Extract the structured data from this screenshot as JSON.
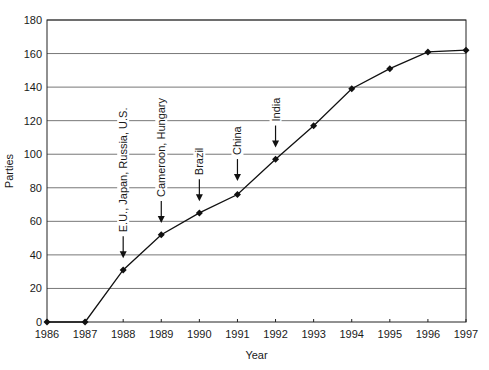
{
  "chart_data": {
    "type": "line",
    "title": "",
    "xlabel": "Year",
    "ylabel": "Parties",
    "x": [
      1986,
      1987,
      1988,
      1989,
      1990,
      1991,
      1992,
      1993,
      1994,
      1995,
      1996,
      1997
    ],
    "series": [
      {
        "name": "Parties",
        "values": [
          0,
          0,
          31,
          52,
          65,
          76,
          97,
          117,
          139,
          151,
          161,
          162
        ]
      }
    ],
    "xlim": [
      1986,
      1997
    ],
    "ylim": [
      0,
      180
    ],
    "yticks": [
      0,
      20,
      40,
      60,
      80,
      100,
      120,
      140,
      160,
      180
    ],
    "xticks": [
      "1986",
      "1987",
      "1988",
      "1989",
      "1990",
      "1991",
      "1992",
      "1993",
      "1994",
      "1995",
      "1996",
      "1997"
    ],
    "grid": "horizontal",
    "legend": null,
    "marker": "diamond",
    "annotations": [
      {
        "x": 1988,
        "arrow_tip": 38,
        "label": "E.U., Japan, Russia, U.S."
      },
      {
        "x": 1989,
        "arrow_tip": 59,
        "label": "Cameroon, Hungary"
      },
      {
        "x": 1990,
        "arrow_tip": 72,
        "label": "Brazil"
      },
      {
        "x": 1991,
        "arrow_tip": 84,
        "label": "China"
      },
      {
        "x": 1992,
        "arrow_tip": 104,
        "label": "India"
      }
    ]
  },
  "labels": {
    "xlabel": "Year",
    "ylabel": "Parties"
  }
}
